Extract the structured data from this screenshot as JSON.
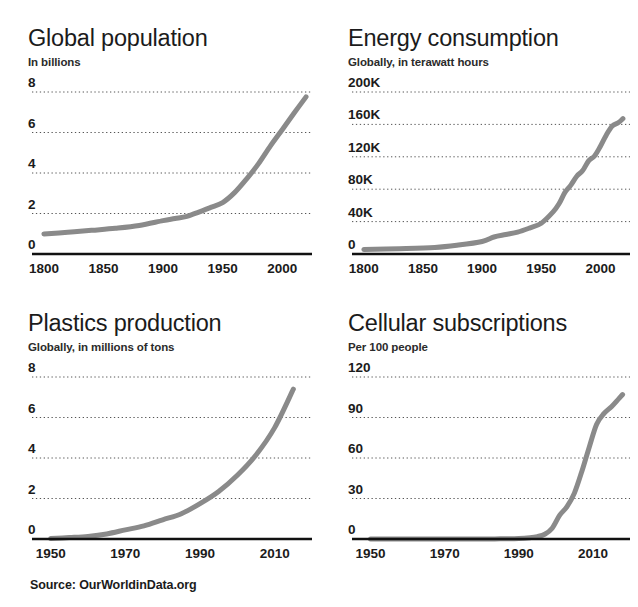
{
  "source": {
    "label": "Source: OurWorldinData.org"
  },
  "panels": [
    {
      "id": "global-population",
      "title": "Global population",
      "subtitle": "In billions"
    },
    {
      "id": "energy-consumption",
      "title": "Energy consumption",
      "subtitle": "Globally, in terawatt hours"
    },
    {
      "id": "plastics-production",
      "title": "Plastics production",
      "subtitle": "Globally, in millions of tons"
    },
    {
      "id": "cellular-subscriptions",
      "title": "Cellular subscriptions",
      "subtitle": "Per 100 people"
    }
  ],
  "chart_data": [
    {
      "type": "line",
      "title": "Global population",
      "subtitle": "In billions",
      "xlabel": "",
      "ylabel": "In billions",
      "xlim": [
        1790,
        2025
      ],
      "ylim": [
        0,
        8
      ],
      "xticks": [
        1800,
        1850,
        1900,
        1950,
        2000
      ],
      "xtick_labels": [
        "1800",
        "1850",
        "1900",
        "1950",
        "2000"
      ],
      "yticks": [
        0,
        2,
        4,
        6,
        8
      ],
      "ytick_labels": [
        "0",
        "2",
        "4",
        "6",
        "8"
      ],
      "grid": true,
      "legend": "none",
      "line_color": "#8a8a8a",
      "x": [
        1800,
        1820,
        1840,
        1860,
        1880,
        1900,
        1910,
        1920,
        1930,
        1940,
        1950,
        1960,
        1970,
        1980,
        1990,
        2000,
        2010,
        2020
      ],
      "values": [
        0.99,
        1.07,
        1.17,
        1.27,
        1.41,
        1.65,
        1.75,
        1.86,
        2.07,
        2.3,
        2.54,
        3.03,
        3.7,
        4.45,
        5.33,
        6.14,
        6.96,
        7.76
      ]
    },
    {
      "type": "line",
      "title": "Energy consumption",
      "subtitle": "Globally, in terawatt hours",
      "xlabel": "",
      "ylabel": "Terawatt hours",
      "xlim": [
        1790,
        2025
      ],
      "ylim": [
        0,
        200000
      ],
      "xticks": [
        1800,
        1850,
        1900,
        1950,
        2000
      ],
      "xtick_labels": [
        "1800",
        "1850",
        "1900",
        "1950",
        "2000"
      ],
      "yticks": [
        0,
        40000,
        80000,
        120000,
        160000,
        200000
      ],
      "ytick_labels": [
        "0",
        "40K",
        "80K",
        "120K",
        "160K",
        "200K"
      ],
      "grid": true,
      "legend": "none",
      "line_color": "#8a8a8a",
      "x": [
        1800,
        1830,
        1860,
        1880,
        1900,
        1910,
        1920,
        1930,
        1940,
        1950,
        1960,
        1965,
        1970,
        1975,
        1980,
        1985,
        1990,
        1995,
        2000,
        2005,
        2010,
        2015,
        2019
      ],
      "values": [
        5600,
        6500,
        8000,
        11000,
        15500,
        21000,
        24000,
        27000,
        32000,
        38000,
        52000,
        62000,
        76000,
        85000,
        96000,
        103000,
        115000,
        121000,
        133000,
        147000,
        158000,
        162000,
        167000
      ]
    },
    {
      "type": "line",
      "title": "Plastics production",
      "subtitle": "Globally, in millions of tons",
      "xlabel": "",
      "ylabel": "Millions of tons",
      "xlim": [
        1945,
        2020
      ],
      "ylim": [
        0,
        8
      ],
      "xticks": [
        1950,
        1970,
        1990,
        2010
      ],
      "xtick_labels": [
        "1950",
        "1970",
        "1990",
        "2010"
      ],
      "yticks": [
        0,
        2,
        4,
        6,
        8
      ],
      "ytick_labels": [
        "0",
        "2",
        "4",
        "6",
        "8"
      ],
      "grid": true,
      "legend": "none",
      "line_color": "#8a8a8a",
      "x": [
        1950,
        1955,
        1960,
        1965,
        1970,
        1975,
        1980,
        1985,
        1990,
        1995,
        2000,
        2005,
        2010,
        2015
      ],
      "values": [
        0.02,
        0.07,
        0.13,
        0.25,
        0.45,
        0.65,
        0.95,
        1.25,
        1.75,
        2.35,
        3.15,
        4.15,
        5.5,
        7.4
      ]
    },
    {
      "type": "line",
      "title": "Cellular subscriptions",
      "subtitle": "Per 100 people",
      "xlabel": "",
      "ylabel": "Per 100 people",
      "xlim": [
        1945,
        2020
      ],
      "ylim": [
        0,
        120
      ],
      "xticks": [
        1950,
        1970,
        1990,
        2010
      ],
      "xtick_labels": [
        "1950",
        "1970",
        "1990",
        "2010"
      ],
      "yticks": [
        0,
        30,
        60,
        90,
        120
      ],
      "ytick_labels": [
        "0",
        "30",
        "60",
        "90",
        "120"
      ],
      "grid": true,
      "legend": "none",
      "line_color": "#8a8a8a",
      "x": [
        1950,
        1970,
        1980,
        1985,
        1990,
        1993,
        1995,
        1997,
        1999,
        2001,
        2003,
        2005,
        2007,
        2009,
        2011,
        2013,
        2015,
        2017,
        2018
      ],
      "values": [
        0,
        0,
        0,
        0.1,
        0.4,
        1.0,
        1.8,
        3.5,
        8.0,
        17.5,
        24.0,
        34.0,
        50.0,
        68.0,
        85.0,
        93.0,
        98.0,
        104.0,
        107.0
      ]
    }
  ]
}
